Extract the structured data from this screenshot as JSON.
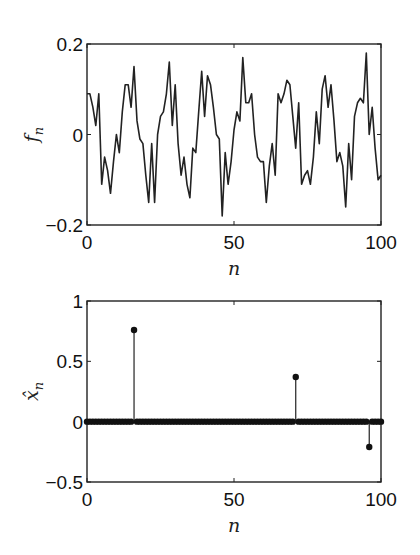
{
  "chart_data": [
    {
      "type": "line",
      "title": "",
      "xlabel": "n",
      "ylabel": "f_n",
      "xlim": [
        0,
        100
      ],
      "ylim": [
        -0.2,
        0.2
      ],
      "xticks": [
        0,
        50,
        100
      ],
      "xtick_labels": [
        "0",
        "50",
        "100"
      ],
      "yticks": [
        -0.2,
        0,
        0.2
      ],
      "ytick_labels": [
        "-0.2",
        "0",
        "0.2"
      ],
      "grid": false,
      "legend": null,
      "x": [
        0,
        1,
        2,
        3,
        4,
        5,
        6,
        7,
        8,
        9,
        10,
        11,
        12,
        13,
        14,
        15,
        16,
        17,
        18,
        19,
        20,
        21,
        22,
        23,
        24,
        25,
        26,
        27,
        28,
        29,
        30,
        31,
        32,
        33,
        34,
        35,
        36,
        37,
        38,
        39,
        40,
        41,
        42,
        43,
        44,
        45,
        46,
        47,
        48,
        49,
        50,
        51,
        52,
        53,
        54,
        55,
        56,
        57,
        58,
        59,
        60,
        61,
        62,
        63,
        64,
        65,
        66,
        67,
        68,
        69,
        70,
        71,
        72,
        73,
        74,
        75,
        76,
        77,
        78,
        79,
        80,
        81,
        82,
        83,
        84,
        85,
        86,
        87,
        88,
        89,
        90,
        91,
        92,
        93,
        94,
        95,
        96,
        97,
        98,
        99,
        100
      ],
      "series": [
        {
          "name": "f_n",
          "values": [
            0.09,
            0.09,
            0.06,
            0.02,
            0.09,
            -0.11,
            -0.05,
            -0.08,
            -0.13,
            -0.06,
            0.0,
            -0.04,
            0.05,
            0.11,
            0.11,
            0.06,
            0.15,
            0.03,
            -0.01,
            -0.02,
            -0.09,
            -0.15,
            -0.02,
            -0.15,
            0.0,
            0.04,
            0.05,
            0.09,
            0.16,
            0.02,
            0.11,
            -0.02,
            -0.09,
            -0.05,
            -0.11,
            -0.14,
            -0.03,
            -0.04,
            0.05,
            0.14,
            0.04,
            0.13,
            0.11,
            0.06,
            0.0,
            -0.01,
            -0.18,
            -0.04,
            -0.11,
            -0.06,
            0.01,
            0.05,
            0.03,
            0.17,
            0.07,
            0.07,
            0.09,
            0.0,
            -0.05,
            -0.06,
            -0.06,
            -0.15,
            -0.07,
            -0.02,
            -0.09,
            0.09,
            0.07,
            0.09,
            0.12,
            0.11,
            0.04,
            -0.03,
            0.07,
            -0.11,
            -0.09,
            -0.08,
            -0.11,
            -0.05,
            0.05,
            -0.02,
            0.1,
            0.13,
            0.06,
            0.11,
            0.03,
            -0.06,
            -0.04,
            -0.07,
            -0.16,
            -0.02,
            -0.1,
            0.04,
            0.07,
            0.08,
            0.07,
            0.18,
            0.0,
            0.06,
            -0.03,
            -0.1,
            -0.09,
            -0.08,
            -0.15,
            -0.0
          ]
        }
      ]
    },
    {
      "type": "stem",
      "title": "",
      "xlabel": "n",
      "ylabel": "x̂_n",
      "xlim": [
        0,
        100
      ],
      "ylim": [
        -0.5,
        1
      ],
      "xticks": [
        0,
        50,
        100
      ],
      "xtick_labels": [
        "0",
        "50",
        "100"
      ],
      "yticks": [
        -0.5,
        0,
        0.5,
        1
      ],
      "ytick_labels": [
        "-0.5",
        "0",
        "0.5",
        "1"
      ],
      "grid": false,
      "legend": null,
      "n_points": 101,
      "nonzero": [
        {
          "n": 16,
          "value": 0.76
        },
        {
          "n": 71,
          "value": 0.37
        },
        {
          "n": 96,
          "value": -0.21
        }
      ],
      "baseline_value": 0
    }
  ]
}
